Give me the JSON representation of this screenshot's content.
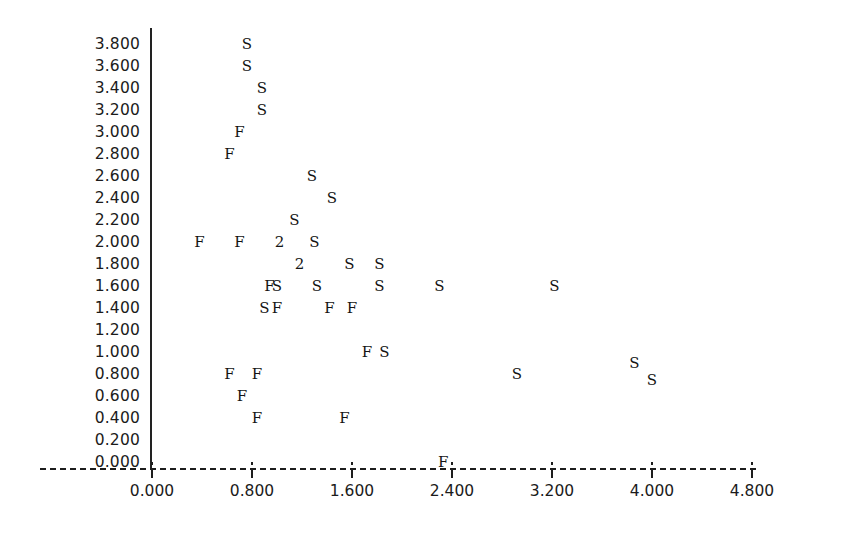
{
  "chart_data": {
    "type": "scatter",
    "title": "",
    "subtitle": "",
    "xlabel": "",
    "ylabel": "",
    "xlim": [
      0.0,
      4.8
    ],
    "ylim": [
      0.0,
      3.8
    ],
    "grid": false,
    "legend_position": "none",
    "marker_encoding": "character glyph per observation; digit '2' denotes two overlapping observations at the same plotting cell",
    "x_ticks": [
      "0.000",
      "0.800",
      "1.600",
      "2.400",
      "3.200",
      "4.000",
      "4.800"
    ],
    "x_tick_values": [
      0.0,
      0.8,
      1.6,
      2.4,
      3.2,
      4.0,
      4.8
    ],
    "y_ticks": [
      "3.800",
      "3.600",
      "3.400",
      "3.200",
      "3.000",
      "2.800",
      "2.600",
      "2.400",
      "2.200",
      "2.000",
      "1.800",
      "1.600",
      "1.400",
      "1.200",
      "1.000",
      "0.800",
      "0.600",
      "0.400",
      "0.200",
      "0.000"
    ],
    "y_tick_values": [
      3.8,
      3.6,
      3.4,
      3.2,
      3.0,
      2.8,
      2.6,
      2.4,
      2.2,
      2.0,
      1.8,
      1.6,
      1.4,
      1.2,
      1.0,
      0.8,
      0.6,
      0.4,
      0.2,
      0.0
    ],
    "series": [
      {
        "name": "S",
        "label": "S",
        "marker": "S",
        "points": [
          {
            "x": 0.76,
            "y": 3.8
          },
          {
            "x": 0.76,
            "y": 3.6
          },
          {
            "x": 0.88,
            "y": 3.4
          },
          {
            "x": 0.88,
            "y": 3.2
          },
          {
            "x": 1.28,
            "y": 2.6
          },
          {
            "x": 1.44,
            "y": 2.4
          },
          {
            "x": 1.14,
            "y": 2.2
          },
          {
            "x": 1.3,
            "y": 2.0
          },
          {
            "x": 1.58,
            "y": 1.8
          },
          {
            "x": 1.82,
            "y": 1.8
          },
          {
            "x": 1.0,
            "y": 1.6
          },
          {
            "x": 1.32,
            "y": 1.6
          },
          {
            "x": 1.82,
            "y": 1.6
          },
          {
            "x": 2.3,
            "y": 1.6
          },
          {
            "x": 3.22,
            "y": 1.6
          },
          {
            "x": 0.9,
            "y": 1.4
          },
          {
            "x": 1.86,
            "y": 1.0
          },
          {
            "x": 2.92,
            "y": 0.8
          },
          {
            "x": 3.86,
            "y": 0.9
          },
          {
            "x": 4.0,
            "y": 0.75
          }
        ]
      },
      {
        "name": "F",
        "label": "F",
        "marker": "F",
        "points": [
          {
            "x": 0.7,
            "y": 3.0
          },
          {
            "x": 0.62,
            "y": 2.8
          },
          {
            "x": 0.38,
            "y": 2.0
          },
          {
            "x": 0.7,
            "y": 2.0
          },
          {
            "x": 0.94,
            "y": 1.6
          },
          {
            "x": 1.0,
            "y": 1.4
          },
          {
            "x": 1.42,
            "y": 1.4
          },
          {
            "x": 1.6,
            "y": 1.4
          },
          {
            "x": 1.72,
            "y": 1.0
          },
          {
            "x": 0.62,
            "y": 0.8
          },
          {
            "x": 0.84,
            "y": 0.8
          },
          {
            "x": 0.72,
            "y": 0.6
          },
          {
            "x": 0.84,
            "y": 0.4
          },
          {
            "x": 1.54,
            "y": 0.4
          },
          {
            "x": 2.33,
            "y": 0.0
          }
        ]
      },
      {
        "name": "2",
        "label": "2",
        "marker": "2",
        "overlap_count": 2,
        "points": [
          {
            "x": 1.02,
            "y": 2.0
          },
          {
            "x": 1.18,
            "y": 1.8
          }
        ]
      }
    ]
  },
  "axis": {
    "y_axis_name": "vertical-axis-rule",
    "x_axis_name": "dashed-horizontal-axis"
  }
}
